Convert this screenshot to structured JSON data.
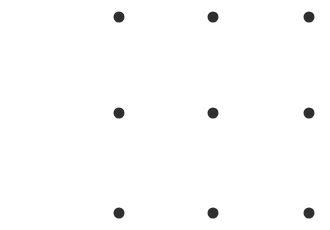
{
  "pattern_grid": {
    "rows": 3,
    "cols": 3,
    "dot_color": "#2f2f2f",
    "background_color": "#ffffff",
    "column_x": [
      119,
      213,
      309
    ],
    "row_y": [
      17,
      113,
      213
    ],
    "dots": [
      {
        "id": 1,
        "row": 0,
        "col": 0
      },
      {
        "id": 2,
        "row": 0,
        "col": 1
      },
      {
        "id": 3,
        "row": 0,
        "col": 2
      },
      {
        "id": 4,
        "row": 1,
        "col": 0
      },
      {
        "id": 5,
        "row": 1,
        "col": 1
      },
      {
        "id": 6,
        "row": 1,
        "col": 2
      },
      {
        "id": 7,
        "row": 2,
        "col": 0
      },
      {
        "id": 8,
        "row": 2,
        "col": 1
      },
      {
        "id": 9,
        "row": 2,
        "col": 2
      }
    ]
  }
}
